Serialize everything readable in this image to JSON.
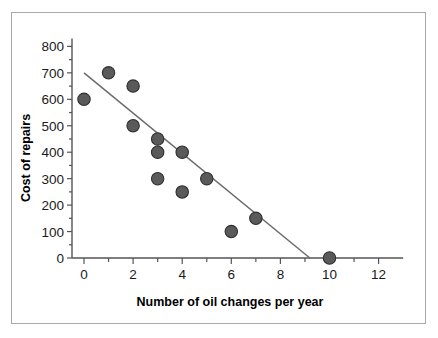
{
  "figure": {
    "frame_border_color": "#a8a8a8",
    "background_color": "#ffffff"
  },
  "chart_data": {
    "type": "scatter",
    "title": "",
    "xlabel": "Number of oil changes per year",
    "ylabel": "Cost of repairs",
    "xlim": [
      -0.5,
      13
    ],
    "ylim": [
      0,
      830
    ],
    "grid": false,
    "legend": null,
    "x_ticks": [
      0,
      2,
      4,
      6,
      8,
      10,
      12
    ],
    "x_tick_labels": [
      "0",
      "2",
      "4",
      "6",
      "8",
      "10",
      "12"
    ],
    "x_minor_ticks": [
      1,
      3,
      5,
      7,
      9,
      11
    ],
    "y_ticks": [
      0,
      100,
      200,
      300,
      400,
      500,
      600,
      700,
      800
    ],
    "y_tick_labels": [
      "0",
      "100",
      "200",
      "300",
      "400",
      "500",
      "600",
      "700",
      "800"
    ],
    "marker_color": "#5a5a5a",
    "marker_edge_color": "#2e2e2e",
    "points": [
      {
        "x": 0,
        "y": 600
      },
      {
        "x": 1,
        "y": 700
      },
      {
        "x": 2,
        "y": 650
      },
      {
        "x": 2,
        "y": 500
      },
      {
        "x": 3,
        "y": 450
      },
      {
        "x": 3,
        "y": 400
      },
      {
        "x": 3,
        "y": 300
      },
      {
        "x": 4,
        "y": 400
      },
      {
        "x": 4,
        "y": 250
      },
      {
        "x": 5,
        "y": 300
      },
      {
        "x": 6,
        "y": 100
      },
      {
        "x": 7,
        "y": 150
      },
      {
        "x": 10,
        "y": 0
      }
    ],
    "trend_line": {
      "color": "#6b6b6b",
      "x_start": 0,
      "y_start": 700,
      "x_end": 9.2,
      "y_end": 0
    }
  }
}
